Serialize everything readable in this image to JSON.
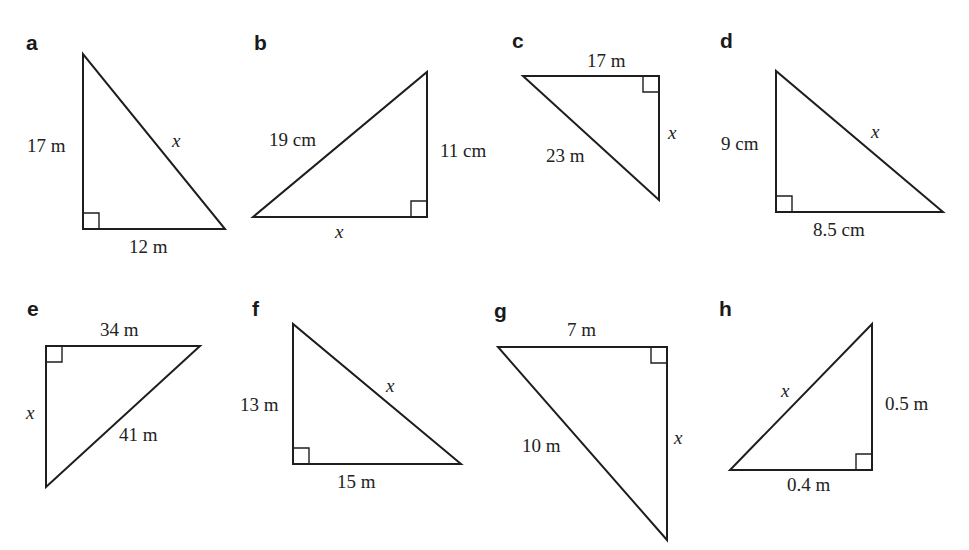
{
  "figure": {
    "stroke_color": "#1e1e1e",
    "background": "#ffffff"
  },
  "problems": [
    {
      "letter": "a",
      "right_angle_at": "bottom-left",
      "sides": {
        "vertical": "17 m",
        "horizontal": "12 m",
        "hypotenuse": "x"
      },
      "labels": [
        {
          "text": "17 m",
          "role": "leg"
        },
        {
          "text": "x",
          "role": "hypotenuse"
        },
        {
          "text": "12 m",
          "role": "leg"
        }
      ]
    },
    {
      "letter": "b",
      "right_angle_at": "bottom-right",
      "sides": {
        "vertical": "11 cm",
        "horizontal": "x",
        "hypotenuse": "19 cm"
      },
      "labels": [
        {
          "text": "19 cm",
          "role": "hypotenuse"
        },
        {
          "text": "11 cm",
          "role": "leg"
        },
        {
          "text": "x",
          "role": "leg"
        }
      ]
    },
    {
      "letter": "c",
      "right_angle_at": "top-right",
      "sides": {
        "vertical": "x",
        "horizontal": "17 m",
        "hypotenuse": "23 m"
      },
      "labels": [
        {
          "text": "17 m",
          "role": "leg"
        },
        {
          "text": "x",
          "role": "leg"
        },
        {
          "text": "23 m",
          "role": "hypotenuse"
        }
      ]
    },
    {
      "letter": "d",
      "right_angle_at": "bottom-left",
      "sides": {
        "vertical": "9 cm",
        "horizontal": "8.5 cm",
        "hypotenuse": "x"
      },
      "labels": [
        {
          "text": "9 cm",
          "role": "leg"
        },
        {
          "text": "x",
          "role": "hypotenuse"
        },
        {
          "text": "8.5 cm",
          "role": "leg"
        }
      ]
    },
    {
      "letter": "e",
      "right_angle_at": "top-left",
      "sides": {
        "vertical": "x",
        "horizontal": "34 m",
        "hypotenuse": "41 m"
      },
      "labels": [
        {
          "text": "34 m",
          "role": "leg"
        },
        {
          "text": "x",
          "role": "leg"
        },
        {
          "text": "41 m",
          "role": "hypotenuse"
        }
      ]
    },
    {
      "letter": "f",
      "right_angle_at": "bottom-left",
      "sides": {
        "vertical": "13 m",
        "horizontal": "15 m",
        "hypotenuse": "x"
      },
      "labels": [
        {
          "text": "13 m",
          "role": "leg"
        },
        {
          "text": "x",
          "role": "hypotenuse"
        },
        {
          "text": "15 m",
          "role": "leg"
        }
      ]
    },
    {
      "letter": "g",
      "right_angle_at": "top-right",
      "sides": {
        "vertical": "x",
        "horizontal": "7 m",
        "hypotenuse": "10 m"
      },
      "labels": [
        {
          "text": "7 m",
          "role": "leg"
        },
        {
          "text": "x",
          "role": "leg"
        },
        {
          "text": "10 m",
          "role": "hypotenuse"
        }
      ]
    },
    {
      "letter": "h",
      "right_angle_at": "bottom-right",
      "sides": {
        "vertical": "0.5 m",
        "horizontal": "0.4 m",
        "hypotenuse": "x"
      },
      "labels": [
        {
          "text": "x",
          "role": "hypotenuse"
        },
        {
          "text": "0.5 m",
          "role": "leg"
        },
        {
          "text": "0.4 m",
          "role": "leg"
        }
      ]
    }
  ]
}
